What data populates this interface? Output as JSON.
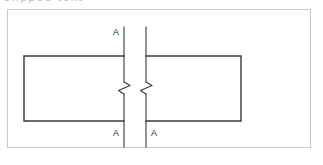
{
  "image": {
    "width": 323,
    "height": 165,
    "background_color": "#ffffff",
    "type": "technical-section-drawing"
  },
  "caption": {
    "text": "clipped text",
    "note": "partially cut off at top edge of image",
    "color": "#b9b9b9"
  },
  "frame": {
    "border_color": "#c9c9c9",
    "x": 7,
    "y": 9,
    "width": 304,
    "height": 139
  },
  "drawing": {
    "line_color": "#3a3a3a",
    "rectangle": {
      "left_x": 24,
      "right_x": 241,
      "top_y": 56,
      "bottom_y": 121,
      "description": "wide horizontal member shown in elevation"
    },
    "break_lines": [
      {
        "name": "left-section-line",
        "x": 124,
        "top_y": 27,
        "bottom_y": 147
      },
      {
        "name": "right-section-line",
        "x": 146,
        "top_y": 27,
        "bottom_y": 147
      }
    ],
    "break_symbols": [
      {
        "name": "left-break-symbol",
        "x": 124,
        "y": 88
      },
      {
        "name": "right-break-symbol",
        "x": 146,
        "y": 88
      }
    ]
  },
  "labels": {
    "section_mark_top_left": "A",
    "section_mark_bottom_left": "A",
    "section_mark_bottom_right": "A",
    "text_color": "#2a2a2a"
  }
}
